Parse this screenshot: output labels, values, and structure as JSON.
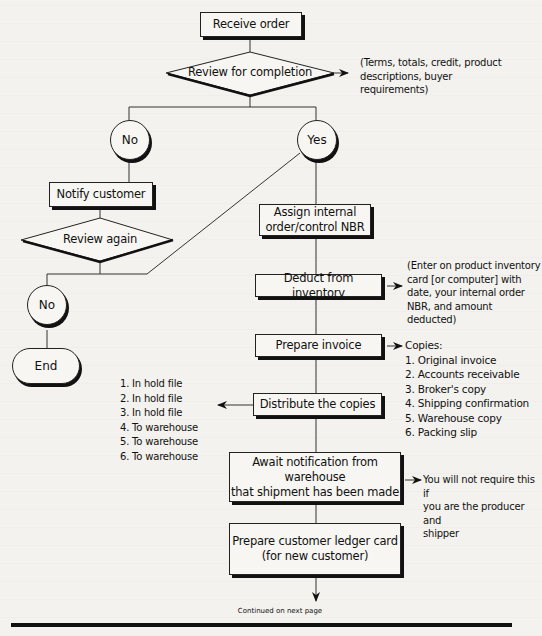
{
  "flowchart": {
    "nodes": {
      "receive_order": "Receive order",
      "review_completion": "Review for completion",
      "no_1": "No",
      "yes": "Yes",
      "notify_customer": "Notify customer",
      "review_again": "Review again",
      "no_2": "No",
      "end": "End",
      "assign_nbr_line1": "Assign internal",
      "assign_nbr_line2": "order/control NBR",
      "deduct_inventory": "Deduct from inventory",
      "prepare_invoice": "Prepare invoice",
      "distribute_copies": "Distribute the copies",
      "await_line1": "Await notification from warehouse",
      "await_line2": "that shipment has been made",
      "ledger_line1": "Prepare customer ledger card",
      "ledger_line2": "(for new customer)"
    },
    "notes": {
      "review_criteria": [
        "(Terms, totals, credit, product",
        "descriptions, buyer",
        "requirements)"
      ],
      "inventory_note": [
        "(Enter on product inventory",
        "card [or computer] with",
        "date, your internal order",
        "NBR, and amount deducted)"
      ],
      "copies_title": "Copies:",
      "copies": [
        "1. Original invoice",
        "2. Accounts receivable",
        "3. Broker's copy",
        "4. Shipping confirmation",
        "5. Warehouse copy",
        "6. Packing slip"
      ],
      "distribution": [
        "1. In hold file",
        "2. In hold file",
        "3. In hold file",
        "4. To warehouse",
        "5. To warehouse",
        "6. To warehouse"
      ],
      "producer_note": [
        "You will not require this if",
        "you are the producer and",
        "shipper"
      ]
    },
    "footer": "Continued on next page"
  }
}
